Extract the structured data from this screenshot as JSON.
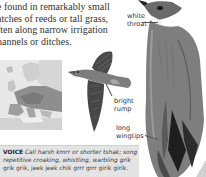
{
  "intro": {
    "lines": [
      "e found in remarkably small",
      "atches of reeds or tall grass,",
      "ften along narrow irrigation",
      "hannels or ditches."
    ]
  },
  "map": {
    "name": "Europe range map"
  },
  "labels": {
    "white_throat": [
      "white",
      "throat"
    ],
    "bright_rump": [
      "bright",
      "rump"
    ],
    "long_wingtips": [
      "long",
      "wingtips"
    ]
  },
  "voice": {
    "heading": "VOICE",
    "line1_call": "Call harsh kmrr or shorter tshak; song",
    "line2": "repetitive croaking, whistling, warbling grik",
    "line3": "grik grik, jeek jeek chik grrr grrr girik girik."
  },
  "colors": {
    "voice_bg": "#e4e4e4",
    "map_bg": "#e6e6e6",
    "text": "#333333"
  }
}
